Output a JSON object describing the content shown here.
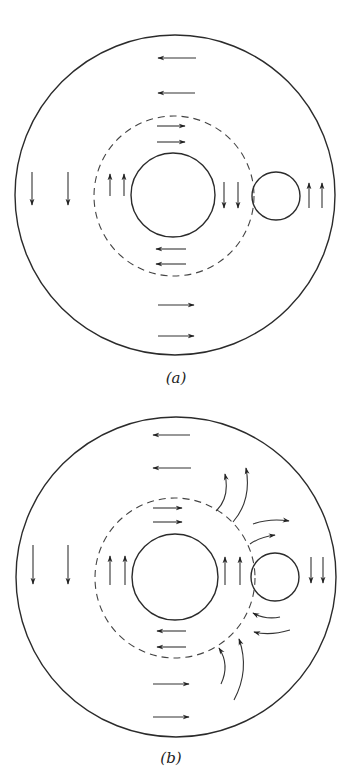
{
  "figure": {
    "panels": [
      {
        "id": "a",
        "label": "(a)",
        "label_pos": [
          176,
          383
        ],
        "outer_circle": {
          "cx": 175,
          "cy": 195,
          "r": 160
        },
        "dashed_circle": {
          "cx": 174,
          "cy": 196,
          "r": 80
        },
        "inner_circle": {
          "cx": 173,
          "cy": 195,
          "r": 42
        },
        "small_circle": {
          "cx": 276,
          "cy": 196,
          "r": 24
        },
        "straight_arrows": [
          {
            "from": [
              196,
              58
            ],
            "to": [
              158,
              58
            ],
            "direction": "left"
          },
          {
            "from": [
              195,
              93
            ],
            "to": [
              158,
              93
            ],
            "direction": "left"
          },
          {
            "from": [
              157,
              126
            ],
            "to": [
              185,
              126
            ],
            "direction": "right"
          },
          {
            "from": [
              157,
              142
            ],
            "to": [
              185,
              142
            ],
            "direction": "right"
          },
          {
            "from": [
              32,
              172
            ],
            "to": [
              32,
              205
            ],
            "direction": "down"
          },
          {
            "from": [
              68,
              172
            ],
            "to": [
              68,
              205
            ],
            "direction": "down"
          },
          {
            "from": [
              110,
              196
            ],
            "to": [
              110,
              174
            ],
            "direction": "up"
          },
          {
            "from": [
              124,
              196
            ],
            "to": [
              124,
              174
            ],
            "direction": "up"
          },
          {
            "from": [
              224,
              182
            ],
            "to": [
              224,
              208
            ],
            "direction": "down"
          },
          {
            "from": [
              238,
              182
            ],
            "to": [
              238,
              208
            ],
            "direction": "down"
          },
          {
            "from": [
              309,
              208
            ],
            "to": [
              309,
              183
            ],
            "direction": "up"
          },
          {
            "from": [
              322,
              208
            ],
            "to": [
              322,
              183
            ],
            "direction": "up"
          },
          {
            "from": [
              186,
              249
            ],
            "to": [
              156,
              249
            ],
            "direction": "left"
          },
          {
            "from": [
              186,
              264
            ],
            "to": [
              156,
              264
            ],
            "direction": "left"
          },
          {
            "from": [
              158,
              305
            ],
            "to": [
              194,
              305
            ],
            "direction": "right"
          },
          {
            "from": [
              158,
              336
            ],
            "to": [
              194,
              336
            ],
            "direction": "right"
          }
        ],
        "curved_arrows": []
      },
      {
        "id": "b",
        "label": "(b)",
        "label_pos": [
          171,
          763
        ],
        "outer_circle": {
          "cx": 176,
          "cy": 577,
          "r": 160
        },
        "dashed_circle": {
          "cx": 175,
          "cy": 578,
          "r": 80
        },
        "inner_circle": {
          "cx": 175,
          "cy": 577,
          "r": 43
        },
        "small_circle": {
          "cx": 275,
          "cy": 577,
          "r": 24
        },
        "straight_arrows": [
          {
            "from": [
              190,
              435
            ],
            "to": [
              153,
              435
            ],
            "direction": "left"
          },
          {
            "from": [
              191,
              468
            ],
            "to": [
              153,
              468
            ],
            "direction": "left"
          },
          {
            "from": [
              153,
              508
            ],
            "to": [
              182,
              508
            ],
            "direction": "right"
          },
          {
            "from": [
              153,
              522
            ],
            "to": [
              182,
              522
            ],
            "direction": "right"
          },
          {
            "from": [
              33,
              545
            ],
            "to": [
              33,
              584
            ],
            "direction": "down"
          },
          {
            "from": [
              68,
              545
            ],
            "to": [
              68,
              584
            ],
            "direction": "down"
          },
          {
            "from": [
              110,
              585
            ],
            "to": [
              110,
              556
            ],
            "direction": "up"
          },
          {
            "from": [
              125,
              585
            ],
            "to": [
              125,
              556
            ],
            "direction": "up"
          },
          {
            "from": [
              225,
              585
            ],
            "to": [
              225,
              557
            ],
            "direction": "up"
          },
          {
            "from": [
              240,
              585
            ],
            "to": [
              240,
              557
            ],
            "direction": "up"
          },
          {
            "from": [
              311,
              557
            ],
            "to": [
              311,
              583
            ],
            "direction": "down"
          },
          {
            "from": [
              323,
              557
            ],
            "to": [
              323,
              583
            ],
            "direction": "down"
          },
          {
            "from": [
              186,
              631
            ],
            "to": [
              157,
              631
            ],
            "direction": "left"
          },
          {
            "from": [
              186,
              647
            ],
            "to": [
              157,
              647
            ],
            "direction": "left"
          },
          {
            "from": [
              153,
              684
            ],
            "to": [
              189,
              684
            ],
            "direction": "right"
          },
          {
            "from": [
              153,
              717
            ],
            "to": [
              189,
              717
            ],
            "direction": "right"
          }
        ],
        "curved_arrows": [
          {
            "d": "M 216 511 Q 230 498 225 474",
            "tip": [
              225,
              474
            ],
            "angle": -95
          },
          {
            "d": "M 233 522 Q 252 500 246 468",
            "tip": [
              246,
              468
            ],
            "angle": -100
          },
          {
            "d": "M 253 524 Q 270 518 289 521",
            "tip": [
              289,
              521
            ],
            "angle": 8
          },
          {
            "d": "M 250 544 Q 260 537 275 535",
            "tip": [
              275,
              535
            ],
            "angle": -5
          },
          {
            "d": "M 280 617 Q 266 620 253 613",
            "tip": [
              253,
              613
            ],
            "angle": 210
          },
          {
            "d": "M 290 630 Q 270 636 254 632",
            "tip": [
              254,
              632
            ],
            "angle": 195
          },
          {
            "d": "M 221 684 Q 230 665 219 648",
            "tip": [
              219,
              648
            ],
            "angle": 240
          },
          {
            "d": "M 234 700 Q 250 670 239 639",
            "tip": [
              239,
              639
            ],
            "angle": 250
          }
        ]
      }
    ]
  }
}
